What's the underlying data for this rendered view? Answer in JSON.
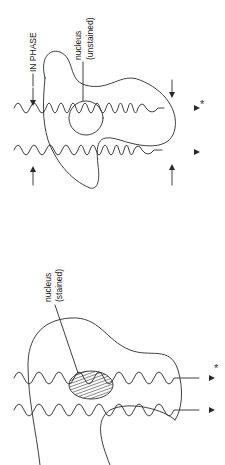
{
  "diagram": {
    "orientation": "rotated 90 degrees clockwise",
    "panels": [
      {
        "id": "unstained",
        "labels": {
          "phase": "IN PHASE",
          "nucleus_line1": "nucleus",
          "nucleus_line2": "(unstained)",
          "marker": "*"
        },
        "waves": 2,
        "arrows": [
          "incoming-top",
          "incoming-bottom",
          "outgoing-top",
          "outgoing-bottom"
        ]
      },
      {
        "id": "stained",
        "labels": {
          "nucleus_line1": "nucleus",
          "nucleus_line2": "(stained)",
          "marker": "*"
        },
        "waves": 2
      }
    ],
    "colors": {
      "line": "#2a2a2a",
      "background": "#ffffff"
    }
  }
}
